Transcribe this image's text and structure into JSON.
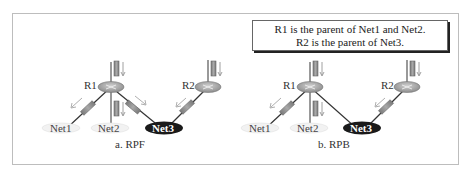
{
  "figure": {
    "panels": [
      {
        "caption": "a. RPF",
        "routers": [
          {
            "label": "R1"
          },
          {
            "label": "R2"
          }
        ],
        "networks": [
          {
            "label": "Net1"
          },
          {
            "label": "Net2"
          },
          {
            "label": "Net3"
          }
        ]
      },
      {
        "caption": "b. RPB",
        "note": {
          "line1": "R1 is the parent of Net1 and Net2.",
          "line2": "R2 is the parent of Net3."
        },
        "routers": [
          {
            "label": "R1"
          },
          {
            "label": "R2"
          }
        ],
        "networks": [
          {
            "label": "Net1"
          },
          {
            "label": "Net2"
          },
          {
            "label": "Net3"
          }
        ]
      }
    ],
    "colors": {
      "packet": "#8a8a8a",
      "router": "#9a9a9a",
      "net3": "#1a1a1a",
      "netLight": "#d8d8d8",
      "frame": "#bdbdbd"
    }
  }
}
